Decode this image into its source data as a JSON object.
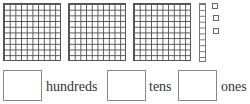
{
  "blocks": {
    "hundreds_flats": 3,
    "tens_rods": 1,
    "ones_units": 3
  },
  "answer_row": {
    "hundreds_label": "hundreds",
    "tens_label": "tens",
    "ones_label": "ones",
    "hundreds_value": "",
    "tens_value": "",
    "ones_value": ""
  },
  "colors": {
    "grid_line": "#555555",
    "box_border": "#888888",
    "text": "#333333"
  }
}
